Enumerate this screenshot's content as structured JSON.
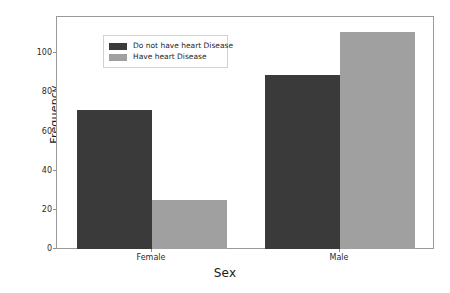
{
  "chart_data": {
    "type": "bar",
    "title": "",
    "xlabel": "Sex",
    "ylabel": "Frequency",
    "categories": [
      "Female",
      "Male"
    ],
    "series": [
      {
        "name": "Do not have heart Disease",
        "color": "#3a3a3a",
        "values": [
          71,
          89
        ]
      },
      {
        "name": "Have heart Disease",
        "color": "#a0a0a0",
        "values": [
          25,
          111
        ]
      }
    ],
    "ylim": [
      0,
      118
    ],
    "yticks": [
      0,
      20,
      40,
      60,
      80,
      100
    ],
    "ytick_labels": [
      "0",
      "20",
      "40",
      "60",
      "80",
      "100"
    ],
    "grid": false,
    "legend_position": "upper left",
    "bar_width": 0.4,
    "background_color": "#ffffff",
    "frame_color": "#9a9a9a"
  }
}
